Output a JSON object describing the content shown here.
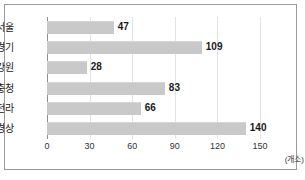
{
  "chart_data": {
    "type": "bar",
    "orientation": "horizontal",
    "title": "",
    "xlabel": "",
    "ylabel": "",
    "unit_label": "(개소)",
    "categories": [
      "서울",
      "경기",
      "강원",
      "충청",
      "전라",
      "경상"
    ],
    "values": [
      47,
      109,
      28,
      83,
      66,
      140
    ],
    "xlim": [
      0,
      150
    ],
    "xticks": [
      0,
      30,
      60,
      90,
      120,
      150
    ],
    "xtick_labels": [
      "0",
      "30",
      "60",
      "90",
      "120",
      "150"
    ],
    "grid": true,
    "legend": null,
    "bar_color": "#c9c9c9",
    "axis_color": "#8f8f8f",
    "grid_color": "#e3e3e3",
    "border_color": "#9a9a9a",
    "value_label_color": "#1a1a1a"
  }
}
